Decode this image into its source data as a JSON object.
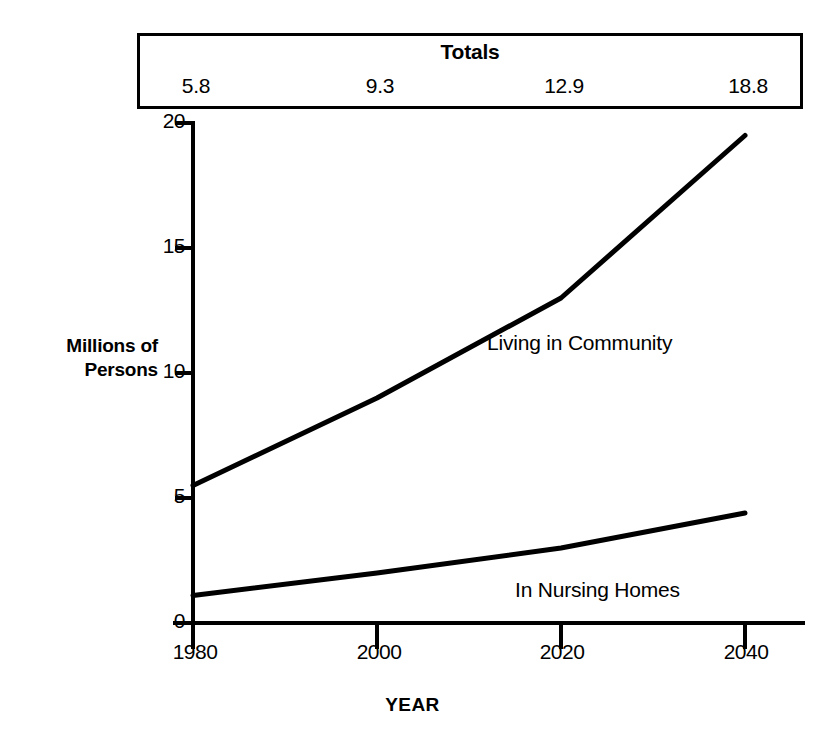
{
  "totals_panel": {
    "title": "Totals",
    "values": [
      "5.8",
      "9.3",
      "12.9",
      "18.8"
    ]
  },
  "axes": {
    "ylabel_line1": "Millions of",
    "ylabel_line2": "Persons",
    "xlabel": "YEAR",
    "yticks": [
      "0",
      "5",
      "10",
      "15",
      "20"
    ],
    "xticks": [
      "1980",
      "2000",
      "2020",
      "2040"
    ]
  },
  "annotations": {
    "community": "Living in Community",
    "nursing": "In Nursing Homes"
  },
  "colors": {
    "ink": "#000000",
    "background": "#ffffff"
  },
  "chart_data": {
    "type": "line",
    "title": "",
    "xlabel": "YEAR",
    "ylabel": "Millions of Persons",
    "x": [
      1980,
      2000,
      2020,
      2040
    ],
    "categories": [
      "1980",
      "2000",
      "2020",
      "2040"
    ],
    "xlim": [
      1980,
      2040
    ],
    "ylim": [
      0,
      20
    ],
    "yticks": [
      0,
      5,
      10,
      15,
      20
    ],
    "xticks": [
      1980,
      2000,
      2020,
      2040
    ],
    "grid": false,
    "legend": "inline-annotations",
    "series": [
      {
        "name": "Living in Community",
        "values": [
          5.5,
          9.0,
          13.0,
          19.5
        ]
      },
      {
        "name": "In Nursing Homes",
        "values": [
          1.1,
          2.0,
          3.0,
          4.4
        ]
      }
    ],
    "totals": {
      "label": "Totals",
      "values": [
        5.8,
        9.3,
        12.9,
        18.8
      ]
    }
  }
}
